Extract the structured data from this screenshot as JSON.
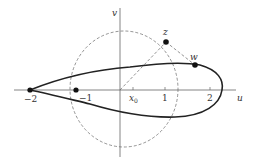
{
  "diagram": {
    "type": "complex-plane-mapping",
    "axes": {
      "horizontal_label": "u",
      "vertical_label": "v"
    },
    "ticks": [
      {
        "label": "−2",
        "value": -2
      },
      {
        "label": "−1",
        "value": -1
      },
      {
        "label": "x",
        "subscript": "0",
        "value": 0.3
      },
      {
        "label": "1",
        "value": 1
      },
      {
        "label": "2",
        "value": 2
      }
    ],
    "points": [
      {
        "name": "z",
        "label": "z"
      },
      {
        "name": "w",
        "label": "w"
      },
      {
        "name": "minus-two",
        "label": ""
      },
      {
        "name": "minus-one",
        "label": ""
      }
    ],
    "curves": [
      {
        "name": "dashed-circle",
        "style": "dashed"
      },
      {
        "name": "airfoil-profile",
        "style": "solid-thick"
      },
      {
        "name": "ray-origin-to-z",
        "style": "dashed"
      },
      {
        "name": "segment-z-to-w",
        "style": "dashed"
      }
    ],
    "colors": {
      "ink": "#222222",
      "axis": "#555555",
      "dashed": "#666666"
    }
  }
}
